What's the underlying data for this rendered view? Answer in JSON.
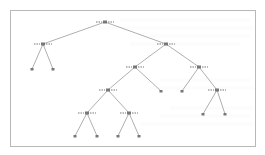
{
  "figure": {
    "type": "binary-tree",
    "colors": {
      "edge": "#9a9a9a",
      "node": "#777777",
      "frame": "#b8b8b8",
      "faint_text": "#ececec"
    }
  },
  "tree": {
    "nodes": [
      {
        "id": "n0",
        "x": 105,
        "y": 22,
        "type": "split"
      },
      {
        "id": "n1",
        "x": 43,
        "y": 44,
        "type": "split"
      },
      {
        "id": "n2",
        "x": 166,
        "y": 44,
        "type": "split"
      },
      {
        "id": "n3",
        "x": 32,
        "y": 69,
        "type": "leaf"
      },
      {
        "id": "n4",
        "x": 53,
        "y": 69,
        "type": "leaf"
      },
      {
        "id": "n5",
        "x": 135,
        "y": 67,
        "type": "split"
      },
      {
        "id": "n6",
        "x": 199,
        "y": 67,
        "type": "split"
      },
      {
        "id": "n7",
        "x": 108,
        "y": 90,
        "type": "split"
      },
      {
        "id": "n8",
        "x": 161,
        "y": 91,
        "type": "leaf"
      },
      {
        "id": "n9",
        "x": 182,
        "y": 91,
        "type": "leaf"
      },
      {
        "id": "n10",
        "x": 217,
        "y": 90,
        "type": "split"
      },
      {
        "id": "n11",
        "x": 87,
        "y": 113,
        "type": "split"
      },
      {
        "id": "n12",
        "x": 129,
        "y": 113,
        "type": "split"
      },
      {
        "id": "n13",
        "x": 203,
        "y": 114,
        "type": "leaf"
      },
      {
        "id": "n14",
        "x": 225,
        "y": 114,
        "type": "leaf"
      },
      {
        "id": "n15",
        "x": 75,
        "y": 136,
        "type": "leaf"
      },
      {
        "id": "n16",
        "x": 97,
        "y": 136,
        "type": "leaf"
      },
      {
        "id": "n17",
        "x": 118,
        "y": 136,
        "type": "leaf"
      },
      {
        "id": "n18",
        "x": 139,
        "y": 136,
        "type": "leaf"
      }
    ],
    "edges": [
      [
        "n0",
        "n1"
      ],
      [
        "n0",
        "n2"
      ],
      [
        "n1",
        "n3"
      ],
      [
        "n1",
        "n4"
      ],
      [
        "n2",
        "n5"
      ],
      [
        "n2",
        "n6"
      ],
      [
        "n5",
        "n7"
      ],
      [
        "n5",
        "n8"
      ],
      [
        "n6",
        "n9"
      ],
      [
        "n6",
        "n10"
      ],
      [
        "n7",
        "n11"
      ],
      [
        "n7",
        "n12"
      ],
      [
        "n10",
        "n13"
      ],
      [
        "n10",
        "n14"
      ],
      [
        "n11",
        "n15"
      ],
      [
        "n11",
        "n16"
      ],
      [
        "n12",
        "n17"
      ],
      [
        "n12",
        "n18"
      ]
    ]
  }
}
